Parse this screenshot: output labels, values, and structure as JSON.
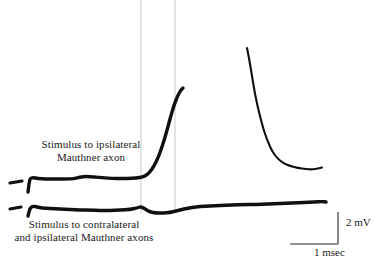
{
  "figure": {
    "type": "electrophysiology-recording",
    "background_color": "#ffffff",
    "trace_color": "#101010",
    "marker_color": "#101010",
    "timing_line_color": "#d9d9d9",
    "scale_bar_color": "#6b6b6b"
  },
  "annotations": {
    "upper_label_line1": "Stimulus to ipsilateral",
    "upper_label_line2": "Mauthner axon",
    "lower_label_line1": "Stimulus to contralateral",
    "lower_label_line2": "and ipsilateral Mauthner axons"
  },
  "scale_bars": {
    "vertical_label": "2 mV",
    "horizontal_label": "1 msec",
    "vertical_value": 2,
    "vertical_unit": "mV",
    "horizontal_value": 1,
    "horizontal_unit": "msec",
    "corner_x": 338,
    "corner_y": 244,
    "vertical_top_y": 212,
    "horizontal_left_x": 290
  },
  "timing_lines": [
    {
      "name": "timing-line-1",
      "x": 141,
      "y_top": 0,
      "y_bottom": 213
    },
    {
      "name": "timing-line-2",
      "x": 175,
      "y_top": 0,
      "y_bottom": 213
    }
  ],
  "stimulus_markers": [
    {
      "name": "stimulus-marker-upper",
      "x1": 10,
      "y1": 183,
      "x2": 22,
      "y2": 181
    },
    {
      "name": "stimulus-marker-lower",
      "x1": 10,
      "y1": 209,
      "x2": 21,
      "y2": 207
    }
  ],
  "chart_data": {
    "type": "line",
    "title": "",
    "xlabel": "time",
    "ylabel": "membrane potential",
    "series": [
      {
        "name": "ipsilateral-stimulus-trace",
        "description": "Upper trace: stimulus to ipsilateral Mauthner axon; flat baseline then steep rising depolarization truncated at top of frame, with a separate decaying repolarization segment at right.",
        "segments": [
          {
            "name": "upper-trace-rising",
            "points": [
              [
                28,
                192
              ],
              [
                29,
                184
              ],
              [
                30,
                178.5
              ],
              [
                33,
                177.5
              ],
              [
                38,
                178.5
              ],
              [
                46,
                179
              ],
              [
                56,
                179
              ],
              [
                66,
                179
              ],
              [
                74,
                178.8
              ],
              [
                80,
                177
              ],
              [
                86,
                176.4
              ],
              [
                94,
                177
              ],
              [
                104,
                177.8
              ],
              [
                112,
                178.4
              ],
              [
                122,
                178.6
              ],
              [
                132,
                178.4
              ],
              [
                140,
                177.6
              ],
              [
                145,
                176.2
              ],
              [
                150,
                172
              ],
              [
                154,
                166
              ],
              [
                158,
                158
              ],
              [
                162,
                147
              ],
              [
                166,
                134
              ],
              [
                170,
                119
              ],
              [
                174,
                105
              ],
              [
                178,
                95
              ],
              [
                181,
                90
              ],
              [
                183,
                88
              ]
            ]
          },
          {
            "name": "upper-trace-decay",
            "points": [
              [
                247,
                48
              ],
              [
                249,
                58
              ],
              [
                251,
                70
              ],
              [
                253,
                82
              ],
              [
                255,
                94
              ],
              [
                258,
                108
              ],
              [
                261,
                120
              ],
              [
                264,
                131
              ],
              [
                268,
                142
              ],
              [
                272,
                151
              ],
              [
                277,
                158
              ],
              [
                283,
                163
              ],
              [
                290,
                166
              ],
              [
                298,
                168
              ],
              [
                306,
                169
              ],
              [
                312,
                169.5
              ],
              [
                318,
                168.5
              ],
              [
                322,
                167.5
              ]
            ]
          }
        ]
      },
      {
        "name": "contralateral-and-ipsilateral-stimulus-trace",
        "description": "Lower trace: stimulus to contralateral and ipsilateral Mauthner axons; essentially flat noisy baseline with a small notch near the timing lines and a gentle rise toward the right.",
        "segments": [
          {
            "name": "lower-trace-baseline",
            "points": [
              [
                28,
                216
              ],
              [
                30,
                208
              ],
              [
                33,
                206
              ],
              [
                37,
                207
              ],
              [
                42,
                208
              ],
              [
                50,
                208.5
              ],
              [
                60,
                209
              ],
              [
                70,
                209.5
              ],
              [
                80,
                210
              ],
              [
                90,
                210
              ],
              [
                100,
                210.5
              ],
              [
                110,
                210.5
              ],
              [
                120,
                210
              ],
              [
                130,
                209.5
              ],
              [
                137,
                208
              ],
              [
                141,
                206.5
              ],
              [
                145,
                209
              ],
              [
                150,
                212
              ],
              [
                156,
                213
              ],
              [
                163,
                213
              ],
              [
                170,
                212.5
              ],
              [
                176,
                211
              ],
              [
                184,
                209
              ],
              [
                192,
                207.5
              ],
              [
                200,
                206.5
              ],
              [
                210,
                206
              ],
              [
                220,
                205.5
              ],
              [
                232,
                205
              ],
              [
                244,
                204.5
              ],
              [
                256,
                204.5
              ],
              [
                268,
                204
              ],
              [
                280,
                203.5
              ],
              [
                292,
                203
              ],
              [
                304,
                202.5
              ],
              [
                314,
                202
              ],
              [
                322,
                201.5
              ],
              [
                326,
                202
              ]
            ]
          }
        ]
      }
    ],
    "grid": false,
    "legend": "none"
  }
}
